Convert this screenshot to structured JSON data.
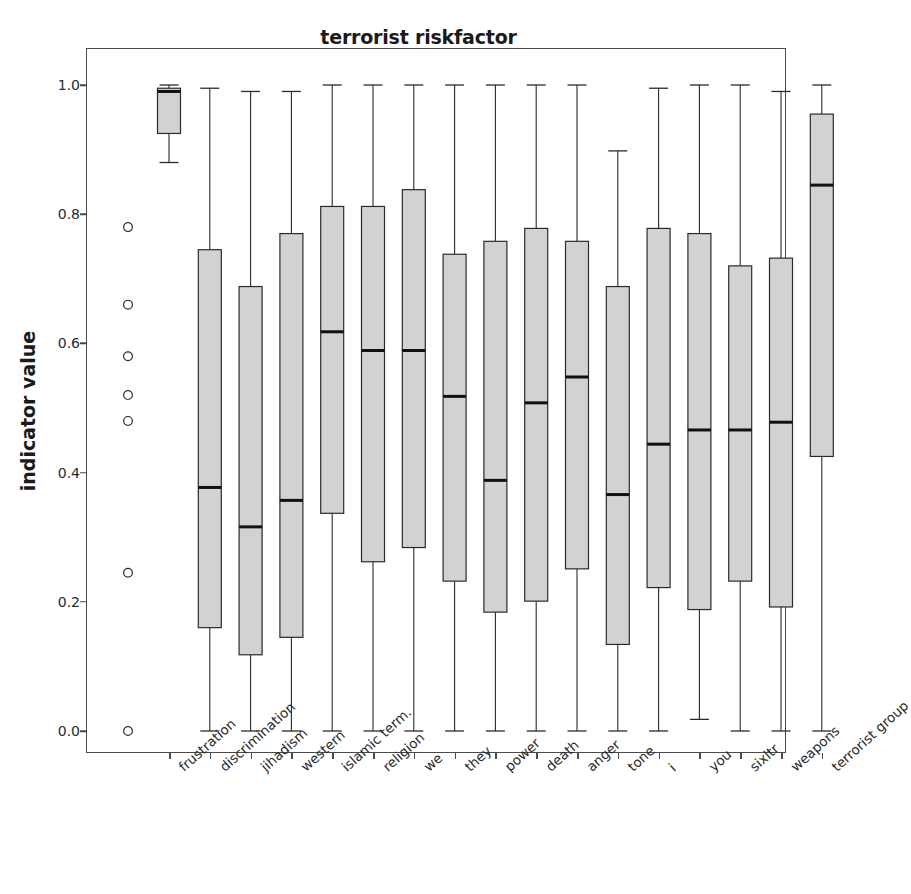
{
  "chart_data": {
    "type": "box",
    "title": "terrorist riskfactor",
    "xlabel": "",
    "ylabel": "indicator value",
    "ylim": [
      -0.03,
      1.03
    ],
    "yticks": [
      0.0,
      0.2,
      0.4,
      0.6,
      0.8,
      1.0
    ],
    "ytick_labels": [
      "0.0",
      "0.2",
      "0.4",
      "0.6",
      "0.8",
      "1.0"
    ],
    "grid": false,
    "legend": null,
    "box_facecolor": "#d2d2d2",
    "box_edgecolor": "#2b2b2b",
    "median_color": "#111111",
    "categories": [
      "frustration",
      "discrimination",
      "jihadism",
      "western",
      "islamic term.",
      "religion",
      "we",
      "they",
      "power",
      "death",
      "anger",
      "tone",
      "i",
      "you",
      "sixltr",
      "weapons",
      "terrorist group"
    ],
    "boxes": [
      {
        "label": "frustration",
        "whisker_low": 0.88,
        "q1": 0.925,
        "median": 0.99,
        "q3": 0.995,
        "whisker_high": 1.0,
        "outliers": [
          0.78,
          0.66,
          0.58,
          0.52,
          0.48,
          0.245,
          0.0
        ]
      },
      {
        "label": "discrimination",
        "whisker_low": 0.0,
        "q1": 0.16,
        "median": 0.377,
        "q3": 0.745,
        "whisker_high": 0.995,
        "outliers": []
      },
      {
        "label": "jihadism",
        "whisker_low": 0.0,
        "q1": 0.118,
        "median": 0.316,
        "q3": 0.688,
        "whisker_high": 0.99,
        "outliers": []
      },
      {
        "label": "western",
        "whisker_low": 0.0,
        "q1": 0.145,
        "median": 0.357,
        "q3": 0.77,
        "whisker_high": 0.99,
        "outliers": []
      },
      {
        "label": "islamic term.",
        "whisker_low": 0.0,
        "q1": 0.337,
        "median": 0.618,
        "q3": 0.812,
        "whisker_high": 1.0,
        "outliers": []
      },
      {
        "label": "religion",
        "whisker_low": 0.0,
        "q1": 0.262,
        "median": 0.589,
        "q3": 0.812,
        "whisker_high": 1.0,
        "outliers": []
      },
      {
        "label": "we",
        "whisker_low": 0.0,
        "q1": 0.284,
        "median": 0.589,
        "q3": 0.838,
        "whisker_high": 1.0,
        "outliers": []
      },
      {
        "label": "they",
        "whisker_low": 0.0,
        "q1": 0.232,
        "median": 0.518,
        "q3": 0.738,
        "whisker_high": 1.0,
        "outliers": []
      },
      {
        "label": "power",
        "whisker_low": 0.0,
        "q1": 0.184,
        "median": 0.388,
        "q3": 0.758,
        "whisker_high": 1.0,
        "outliers": []
      },
      {
        "label": "death",
        "whisker_low": 0.0,
        "q1": 0.201,
        "median": 0.508,
        "q3": 0.778,
        "whisker_high": 1.0,
        "outliers": []
      },
      {
        "label": "anger",
        "whisker_low": 0.0,
        "q1": 0.251,
        "median": 0.548,
        "q3": 0.758,
        "whisker_high": 1.0,
        "outliers": []
      },
      {
        "label": "tone",
        "whisker_low": 0.0,
        "q1": 0.134,
        "median": 0.366,
        "q3": 0.688,
        "whisker_high": 0.898,
        "outliers": []
      },
      {
        "label": "i",
        "whisker_low": 0.0,
        "q1": 0.222,
        "median": 0.444,
        "q3": 0.778,
        "whisker_high": 0.995,
        "outliers": []
      },
      {
        "label": "you",
        "whisker_low": 0.018,
        "q1": 0.188,
        "median": 0.466,
        "q3": 0.77,
        "whisker_high": 1.0,
        "outliers": []
      },
      {
        "label": "sixltr",
        "whisker_low": 0.0,
        "q1": 0.232,
        "median": 0.466,
        "q3": 0.72,
        "whisker_high": 1.0,
        "outliers": []
      },
      {
        "label": "weapons",
        "whisker_low": 0.0,
        "q1": 0.192,
        "median": 0.478,
        "q3": 0.732,
        "whisker_high": 0.99,
        "outliers": []
      },
      {
        "label": "terrorist group",
        "whisker_low": 0.0,
        "q1": 0.425,
        "median": 0.845,
        "q3": 0.955,
        "whisker_high": 1.0,
        "outliers": []
      }
    ]
  }
}
